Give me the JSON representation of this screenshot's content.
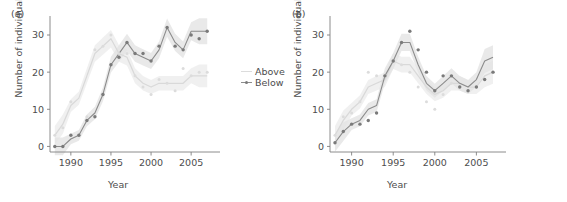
{
  "figure": {
    "background": "#ffffff",
    "width": 567,
    "height": 202
  },
  "legend": {
    "position": "right-of-panel-a",
    "entries": [
      {
        "label": "Above",
        "color": "#dcdcdc",
        "marker": "line"
      },
      {
        "label": "Below",
        "color": "#8c8c8c",
        "marker": "line-point"
      }
    ]
  },
  "panels": [
    {
      "key": "a",
      "label": "(a)",
      "xlabel": "Year",
      "ylabel": "Number of individuals"
    },
    {
      "key": "b",
      "label": "(b)",
      "xlabel": "Year",
      "ylabel": "Number of individuals"
    }
  ],
  "chart_data": [
    {
      "type": "line",
      "panel": "(a)",
      "title": "",
      "xlabel": "Year",
      "ylabel": "Number of individuals",
      "xlim": [
        1987.4,
        2007.6
      ],
      "ylim": [
        -1.5,
        33.5
      ],
      "xticks": [
        1990,
        1995,
        2000,
        2005
      ],
      "yticks": [
        0,
        10,
        20,
        30
      ],
      "grid": false,
      "legend_position": "right",
      "x": [
        1988,
        1989,
        1990,
        1991,
        1992,
        1993,
        1994,
        1995,
        1996,
        1997,
        1998,
        1999,
        2000,
        2001,
        2002,
        2003,
        2004,
        2005,
        2006,
        2007
      ],
      "series": [
        {
          "name": "Above",
          "color": "#dcdcdc",
          "values": [
            3,
            5,
            12,
            3,
            8,
            26,
            27,
            30,
            25,
            25,
            19,
            16,
            14,
            18,
            17,
            15,
            21,
            19,
            20,
            20
          ],
          "fit": [
            3,
            6,
            11,
            13,
            19,
            25,
            27,
            29,
            25,
            24,
            19,
            17,
            16,
            17,
            17,
            17,
            17,
            19,
            19,
            19
          ],
          "band": true
        },
        {
          "name": "Below",
          "color": "#8c8c8c",
          "values": [
            0,
            0,
            3,
            3,
            7,
            8,
            14,
            22,
            24,
            28,
            25,
            25,
            23,
            27,
            32,
            27,
            26,
            30,
            29,
            31
          ],
          "fit": [
            0,
            0,
            2,
            3,
            7,
            9,
            14,
            22,
            25,
            28,
            25,
            24,
            23,
            26,
            32,
            28,
            26,
            31,
            31,
            31
          ],
          "band": true
        }
      ]
    },
    {
      "type": "line",
      "panel": "(b)",
      "title": "",
      "xlabel": "Year",
      "ylabel": "Number of individuals",
      "xlim": [
        1987.4,
        2007.6
      ],
      "ylim": [
        -1.5,
        33.5
      ],
      "xticks": [
        1990,
        1995,
        2000,
        2005
      ],
      "yticks": [
        0,
        10,
        20,
        30
      ],
      "grid": false,
      "legend_position": "none",
      "x": [
        1988,
        1989,
        1990,
        1991,
        1992,
        1993,
        1994,
        1995,
        1996,
        1997,
        1998,
        1999,
        2000,
        2001,
        2002,
        2003,
        2004,
        2005,
        2006,
        2007
      ],
      "series": [
        {
          "name": "Above",
          "color": "#dcdcdc",
          "values": [
            3,
            8,
            9,
            12,
            20,
            19,
            19,
            23,
            22,
            20,
            16,
            12,
            10,
            14,
            17,
            16,
            15,
            16,
            18,
            20
          ],
          "fit": [
            3,
            7,
            10,
            12,
            16,
            17,
            18,
            23,
            22,
            22,
            19,
            16,
            14,
            15,
            17,
            17,
            16,
            16,
            19,
            20
          ],
          "band": true
        },
        {
          "name": "Below",
          "color": "#8c8c8c",
          "values": [
            1,
            4,
            6,
            6,
            7,
            9,
            19,
            23,
            28,
            31,
            26,
            20,
            15,
            19,
            19,
            16,
            15,
            16,
            18,
            20
          ],
          "fit": [
            1,
            4,
            6,
            7,
            10,
            11,
            19,
            23,
            28,
            28,
            22,
            17,
            15,
            17,
            19,
            17,
            16,
            18,
            23,
            24
          ],
          "band": true
        }
      ]
    }
  ]
}
